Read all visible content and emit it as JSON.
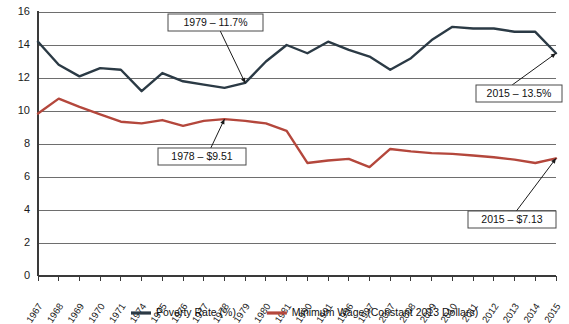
{
  "chart_data": {
    "type": "line",
    "title": "",
    "xlabel": "",
    "ylabel": "",
    "ylim": [
      0,
      16
    ],
    "ytick_step": 2,
    "yticks": [
      "0",
      "2",
      "4",
      "6",
      "8",
      "10",
      "12",
      "14",
      "16"
    ],
    "grid": true,
    "legend_position": "bottom",
    "categories": [
      "1967",
      "1968",
      "1969",
      "1970",
      "1971",
      "1974",
      "1975",
      "1976",
      "1977",
      "1978",
      "1979",
      "1980",
      "1981",
      "1990",
      "1991",
      "1996",
      "1997",
      "2007",
      "2008",
      "2009",
      "2010",
      "2011",
      "2012",
      "2013",
      "2014",
      "2015"
    ],
    "series": [
      {
        "name": "Poverty Rate (%)",
        "color": "#2b3a45",
        "unit": "%",
        "values": [
          14.2,
          12.8,
          12.1,
          12.6,
          12.5,
          11.2,
          12.3,
          11.8,
          11.6,
          11.4,
          11.7,
          13.0,
          14.0,
          13.5,
          14.2,
          13.7,
          13.3,
          12.5,
          13.2,
          14.3,
          15.1,
          15.0,
          15.0,
          14.8,
          14.8,
          13.5
        ]
      },
      {
        "name": "Minimum Wage (Constant 2013 Dollars)",
        "color": "#b4473c",
        "unit": "$",
        "values": [
          9.85,
          10.75,
          10.25,
          9.8,
          9.35,
          9.25,
          9.45,
          9.1,
          9.4,
          9.51,
          9.4,
          9.25,
          8.8,
          6.85,
          7.0,
          7.1,
          6.6,
          7.7,
          7.55,
          7.45,
          7.4,
          7.3,
          7.2,
          7.05,
          6.85,
          7.13
        ]
      }
    ],
    "annotations": [
      {
        "id": "poverty-1979",
        "label": "1979 – 11.7%",
        "series": "Poverty Rate (%)",
        "year": "1979",
        "value": 11.7
      },
      {
        "id": "poverty-2015",
        "label": "2015 – 13.5%",
        "series": "Poverty Rate (%)",
        "year": "2015",
        "value": 13.5
      },
      {
        "id": "wage-1978",
        "label": "1978 – $9.51",
        "series": "Minimum Wage (Constant 2013 Dollars)",
        "year": "1978",
        "value": 9.51
      },
      {
        "id": "wage-2015",
        "label": "2015 – $7.13",
        "series": "Minimum Wage (Constant 2013 Dollars)",
        "year": "2015",
        "value": 7.13
      }
    ],
    "legend": [
      {
        "label": "Poverty Rate (%)",
        "color": "#2b3a45"
      },
      {
        "label": "Minimum Wage (Constant 2013 Dollars)",
        "color": "#b4473c"
      }
    ]
  }
}
